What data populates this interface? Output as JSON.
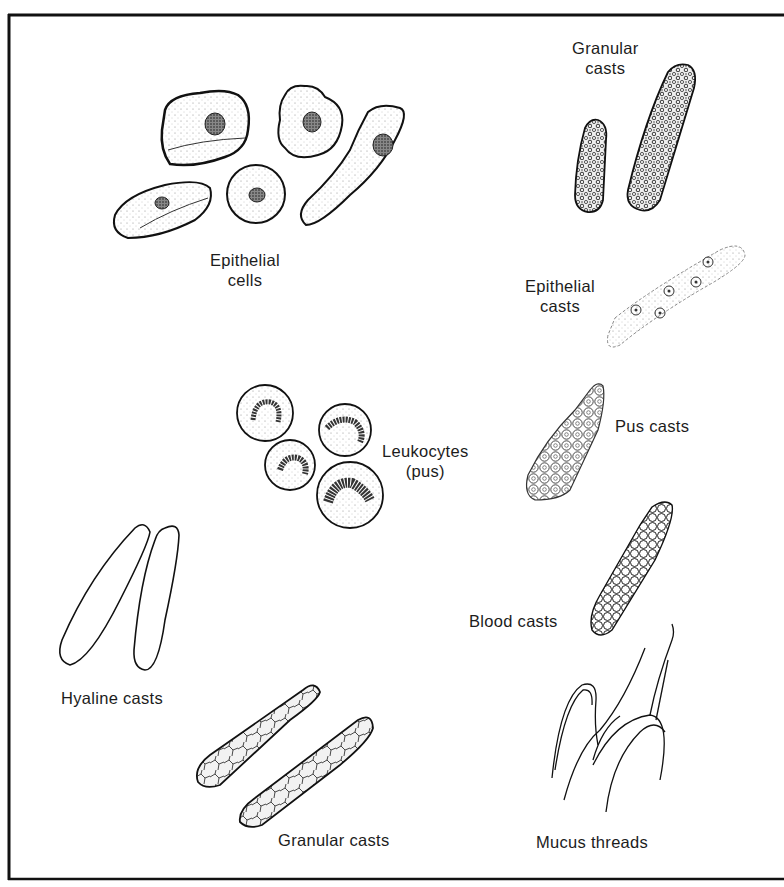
{
  "figure": {
    "border_color": "#111111",
    "background": "#ffffff"
  },
  "labels": {
    "epithelial_cells": [
      "Epithelial",
      "cells"
    ],
    "granular_casts_top": [
      "Granular",
      "casts"
    ],
    "epithelial_casts": [
      "Epithelial",
      "casts"
    ],
    "leukocytes": [
      "Leukocytes",
      "(pus)"
    ],
    "pus_casts": "Pus casts",
    "blood_casts": "Blood casts",
    "hyaline_casts": "Hyaline casts",
    "granular_casts_bottom": "Granular casts",
    "mucus_threads": "Mucus threads"
  },
  "elements": [
    {
      "name": "Epithelial cells",
      "count": 5
    },
    {
      "name": "Granular casts (top)",
      "count": 2
    },
    {
      "name": "Epithelial casts",
      "count": 1
    },
    {
      "name": "Leukocytes (pus)",
      "count": 4
    },
    {
      "name": "Pus casts",
      "count": 1
    },
    {
      "name": "Blood casts",
      "count": 1
    },
    {
      "name": "Hyaline casts",
      "count": 2
    },
    {
      "name": "Granular casts (bottom)",
      "count": 2
    },
    {
      "name": "Mucus threads",
      "count": 1
    }
  ]
}
